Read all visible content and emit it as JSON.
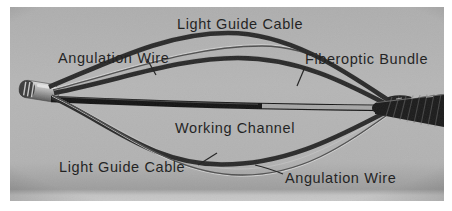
{
  "figure": {
    "photo_bg": "#b6b6b6",
    "label_color": "#1d1d1d",
    "cable_color": "#2a2a2a",
    "wire_color": "#4f4f4f",
    "working_channel_color": "#141414",
    "sheath_color": "#1b1b1b",
    "labels": {
      "light_guide_cable_top": "Light Guide Cable",
      "angulation_wire_left": "Angulation Wire",
      "fiberoptic_bundle": "Fiberoptic Bundle",
      "working_channel": "Working Channel",
      "light_guide_cable_bottom": "Light Guide Cable",
      "angulation_wire_right": "Angulation Wire"
    }
  }
}
